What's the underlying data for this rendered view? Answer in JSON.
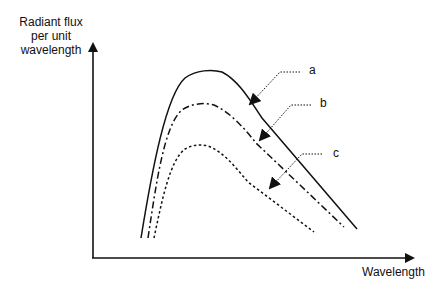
{
  "diagram": {
    "y_axis_label": [
      "Radiant flux",
      "per unit",
      "wavelength"
    ],
    "x_axis_label": "Wavelength",
    "curves": [
      {
        "id": "a",
        "label": "a",
        "style": "solid"
      },
      {
        "id": "b",
        "label": "b",
        "style": "dash-dot"
      },
      {
        "id": "c",
        "label": "c",
        "style": "dotted"
      }
    ],
    "colors": {
      "line": "#111111",
      "background": "#ffffff"
    }
  }
}
